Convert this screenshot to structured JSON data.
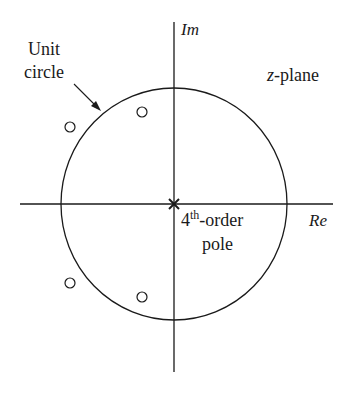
{
  "diagram": {
    "type": "pole-zero plot",
    "plane_label": "z-plane",
    "plane_label_var": "z",
    "plane_label_suffix": "-plane",
    "axes": {
      "real_label": "Re",
      "imag_label": "Im"
    },
    "unit_circle_label_line1": "Unit",
    "unit_circle_label_line2": "circle",
    "pole_label_num": "4",
    "pole_label_sup": "th",
    "pole_label_rest": "-order",
    "pole_label_line2": "pole",
    "pole": {
      "location": "origin",
      "order": 4,
      "marker": "x"
    },
    "zeros": [
      {
        "quadrant": "II",
        "inside_unit_circle": true,
        "marker": "o"
      },
      {
        "quadrant": "II",
        "inside_unit_circle": false,
        "marker": "o"
      },
      {
        "quadrant": "III",
        "inside_unit_circle": false,
        "marker": "o"
      },
      {
        "quadrant": "III",
        "inside_unit_circle": true,
        "marker": "o"
      }
    ],
    "colors": {
      "stroke": "#1a1a1a",
      "background": "#ffffff"
    }
  }
}
